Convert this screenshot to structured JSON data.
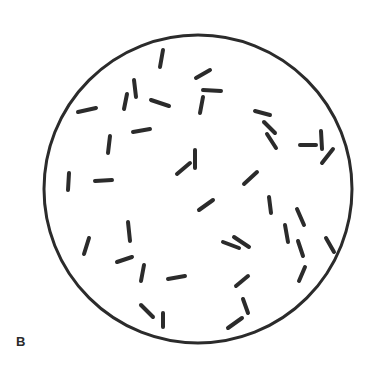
{
  "figure": {
    "panel_label": "B",
    "colors": {
      "background": "#ffffff",
      "ink": "#2b2b2b"
    },
    "field": {
      "cx": 198,
      "cy": 189,
      "r": 154,
      "stroke_width": 3
    },
    "rods": [
      {
        "x1": 163,
        "y1": 50,
        "x2": 160,
        "y2": 67
      },
      {
        "x1": 210,
        "y1": 70,
        "x2": 196,
        "y2": 78
      },
      {
        "x1": 134,
        "y1": 80,
        "x2": 136,
        "y2": 97
      },
      {
        "x1": 127,
        "y1": 94,
        "x2": 124,
        "y2": 109
      },
      {
        "x1": 203,
        "y1": 90,
        "x2": 221,
        "y2": 91
      },
      {
        "x1": 151,
        "y1": 100,
        "x2": 169,
        "y2": 106
      },
      {
        "x1": 203,
        "y1": 97,
        "x2": 200,
        "y2": 113
      },
      {
        "x1": 78,
        "y1": 112,
        "x2": 96,
        "y2": 108
      },
      {
        "x1": 255,
        "y1": 111,
        "x2": 270,
        "y2": 115
      },
      {
        "x1": 264,
        "y1": 122,
        "x2": 275,
        "y2": 133
      },
      {
        "x1": 133,
        "y1": 132,
        "x2": 150,
        "y2": 129
      },
      {
        "x1": 267,
        "y1": 134,
        "x2": 276,
        "y2": 148
      },
      {
        "x1": 110,
        "y1": 136,
        "x2": 108,
        "y2": 153
      },
      {
        "x1": 321,
        "y1": 131,
        "x2": 322,
        "y2": 149
      },
      {
        "x1": 300,
        "y1": 145,
        "x2": 316,
        "y2": 145
      },
      {
        "x1": 333,
        "y1": 149,
        "x2": 322,
        "y2": 163
      },
      {
        "x1": 195,
        "y1": 150,
        "x2": 195,
        "y2": 168
      },
      {
        "x1": 190,
        "y1": 163,
        "x2": 177,
        "y2": 174
      },
      {
        "x1": 69,
        "y1": 173,
        "x2": 68,
        "y2": 190
      },
      {
        "x1": 95,
        "y1": 181,
        "x2": 112,
        "y2": 180
      },
      {
        "x1": 257,
        "y1": 172,
        "x2": 244,
        "y2": 184
      },
      {
        "x1": 213,
        "y1": 200,
        "x2": 199,
        "y2": 210
      },
      {
        "x1": 269,
        "y1": 197,
        "x2": 271,
        "y2": 213
      },
      {
        "x1": 297,
        "y1": 209,
        "x2": 304,
        "y2": 225
      },
      {
        "x1": 128,
        "y1": 222,
        "x2": 130,
        "y2": 241
      },
      {
        "x1": 285,
        "y1": 225,
        "x2": 288,
        "y2": 242
      },
      {
        "x1": 234,
        "y1": 237,
        "x2": 249,
        "y2": 247
      },
      {
        "x1": 223,
        "y1": 242,
        "x2": 239,
        "y2": 248
      },
      {
        "x1": 89,
        "y1": 238,
        "x2": 84,
        "y2": 254
      },
      {
        "x1": 298,
        "y1": 241,
        "x2": 303,
        "y2": 256
      },
      {
        "x1": 326,
        "y1": 238,
        "x2": 334,
        "y2": 252
      },
      {
        "x1": 132,
        "y1": 257,
        "x2": 117,
        "y2": 262
      },
      {
        "x1": 144,
        "y1": 265,
        "x2": 141,
        "y2": 281
      },
      {
        "x1": 305,
        "y1": 267,
        "x2": 299,
        "y2": 281
      },
      {
        "x1": 168,
        "y1": 279,
        "x2": 185,
        "y2": 276
      },
      {
        "x1": 248,
        "y1": 276,
        "x2": 236,
        "y2": 286
      },
      {
        "x1": 141,
        "y1": 305,
        "x2": 153,
        "y2": 317
      },
      {
        "x1": 243,
        "y1": 299,
        "x2": 248,
        "y2": 313
      },
      {
        "x1": 163,
        "y1": 313,
        "x2": 163,
        "y2": 327
      },
      {
        "x1": 242,
        "y1": 318,
        "x2": 228,
        "y2": 328
      }
    ]
  }
}
